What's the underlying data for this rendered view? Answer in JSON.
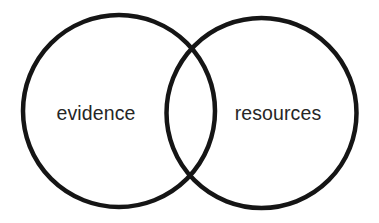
{
  "diagram": {
    "type": "venn",
    "stroke_color": "#151515",
    "text_color": "#262626",
    "background": "#ffffff",
    "sets": [
      {
        "id": "left",
        "label": "evidence",
        "cx": 119,
        "cy": 111,
        "r": 96
      },
      {
        "id": "right",
        "label": "resources",
        "cx": 261.5,
        "cy": 113,
        "r": 95
      }
    ],
    "intersection_label": ""
  }
}
